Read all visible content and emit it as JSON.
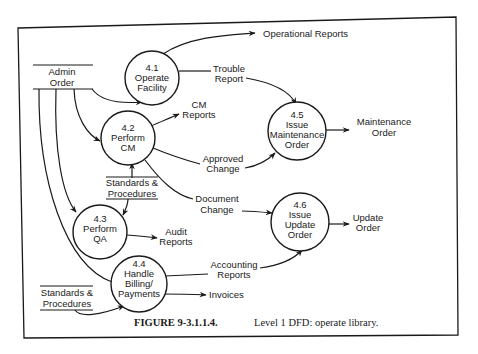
{
  "figure": {
    "caption_number": "FIGURE 9-3.1.1.4.",
    "caption_text": "Level 1 DFD: operate library."
  },
  "processes": [
    {
      "id": "4.1",
      "lines": [
        "4.1",
        "Operate",
        "Facility"
      ]
    },
    {
      "id": "4.2",
      "lines": [
        "4.2",
        "Perform",
        "CM"
      ]
    },
    {
      "id": "4.3",
      "lines": [
        "4.3",
        "Perform",
        "QA"
      ]
    },
    {
      "id": "4.4",
      "lines": [
        "4.4",
        "Handle",
        "Billing/",
        "Payments"
      ]
    },
    {
      "id": "4.5",
      "lines": [
        "4.5",
        "Issue",
        "Maintenance",
        "Order"
      ]
    },
    {
      "id": "4.6",
      "lines": [
        "4.6",
        "Issue",
        "Update",
        "Order"
      ]
    }
  ],
  "data_stores": [
    {
      "id": "admin_order",
      "lines": [
        "Admin",
        "Order"
      ]
    },
    {
      "id": "standards_1",
      "lines": [
        "Standards &",
        "Procedures"
      ]
    },
    {
      "id": "standards_2",
      "lines": [
        "Standards &",
        "Procedures"
      ]
    }
  ],
  "flows": [
    {
      "id": "operational_reports",
      "lines": [
        "Operational Reports"
      ]
    },
    {
      "id": "trouble_report",
      "lines": [
        "Trouble",
        "Report"
      ]
    },
    {
      "id": "cm_reports",
      "lines": [
        "CM",
        "Reports"
      ]
    },
    {
      "id": "approved_change",
      "lines": [
        "Approved",
        "Change"
      ]
    },
    {
      "id": "maintenance_order",
      "lines": [
        "Maintenance",
        "Order"
      ]
    },
    {
      "id": "document_change",
      "lines": [
        "Document",
        "Change"
      ]
    },
    {
      "id": "update_order",
      "lines": [
        "Update",
        "Order"
      ]
    },
    {
      "id": "audit_reports",
      "lines": [
        "Audit",
        "Reports"
      ]
    },
    {
      "id": "accounting_reports",
      "lines": [
        "Accounting",
        "Reports"
      ]
    },
    {
      "id": "invoices",
      "lines": [
        "Invoices"
      ]
    }
  ],
  "colors": {
    "ink": "#1a1a1a",
    "paper": "#ffffff"
  }
}
